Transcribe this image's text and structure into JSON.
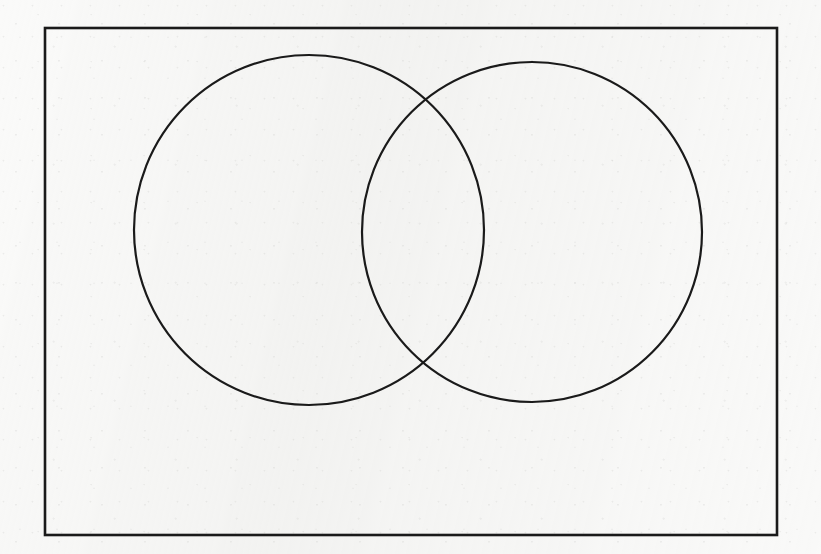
{
  "figure": {
    "title": "Two overlapping circles (Venn diagram)",
    "kind": "venn-two-set-diagram",
    "caption": "",
    "labels": [],
    "background_color": "#f4f4f2",
    "stroke_color": "#1a1a1a",
    "canvas": {
      "width": 821,
      "height": 554
    },
    "frame": {
      "name": "outer-rectangle",
      "x": 45,
      "y": 28,
      "width": 732,
      "height": 507,
      "stroke_width": 2.6,
      "fill": "none"
    },
    "shapes": [
      {
        "name": "left-circle",
        "type": "circle",
        "cx": 309,
        "cy": 230,
        "r": 175,
        "stroke_width": 2.2,
        "fill": "none",
        "label": ""
      },
      {
        "name": "right-circle",
        "type": "circle",
        "cx": 532,
        "cy": 232,
        "r": 170,
        "stroke_width": 2.2,
        "fill": "none",
        "label": ""
      }
    ],
    "intersections": [
      {
        "name": "upper-intersection-point",
        "x": 425,
        "y": 115
      },
      {
        "name": "lower-intersection-point",
        "x": 423,
        "y": 352
      }
    ],
    "regions": [
      {
        "name": "left-only-region",
        "label": ""
      },
      {
        "name": "overlap-region",
        "label": ""
      },
      {
        "name": "right-only-region",
        "label": ""
      },
      {
        "name": "outside-region",
        "label": ""
      }
    ]
  }
}
